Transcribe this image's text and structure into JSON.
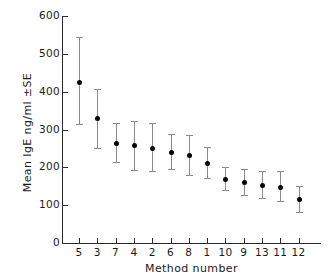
{
  "chart_data": {
    "type": "scatter",
    "title": "",
    "xlabel": "Method number",
    "ylabel": "Mean IgE ng/ml ±SE",
    "xlim": [
      0,
      14
    ],
    "ylim": [
      0,
      600
    ],
    "ytick_labels": [
      "600",
      "500",
      "400",
      "300",
      "200",
      "100",
      "0"
    ],
    "ytick_values": [
      600,
      500,
      400,
      300,
      200,
      100,
      0
    ],
    "grid": false,
    "legend": null,
    "error_bars": "±SE",
    "categories": [
      "5",
      "3",
      "7",
      "4",
      "2",
      "6",
      "8",
      "1",
      "10",
      "9",
      "13",
      "11",
      "12"
    ],
    "values": [
      425,
      330,
      265,
      258,
      252,
      240,
      232,
      212,
      168,
      160,
      152,
      148,
      115
    ],
    "err_low": [
      315,
      250,
      213,
      192,
      190,
      196,
      180,
      172,
      140,
      128,
      118,
      112,
      82
    ],
    "err_high": [
      545,
      408,
      318,
      322,
      318,
      288,
      285,
      255,
      200,
      196,
      190,
      190,
      150
    ],
    "points": [
      {
        "method": "5",
        "mean": 425,
        "low": 315,
        "high": 545
      },
      {
        "method": "3",
        "mean": 330,
        "low": 250,
        "high": 408
      },
      {
        "method": "7",
        "mean": 265,
        "low": 213,
        "high": 318
      },
      {
        "method": "4",
        "mean": 258,
        "low": 192,
        "high": 322
      },
      {
        "method": "2",
        "mean": 252,
        "low": 190,
        "high": 318
      },
      {
        "method": "6",
        "mean": 240,
        "low": 196,
        "high": 288
      },
      {
        "method": "8",
        "mean": 232,
        "low": 180,
        "high": 285
      },
      {
        "method": "1",
        "mean": 212,
        "low": 172,
        "high": 255
      },
      {
        "method": "10",
        "mean": 168,
        "low": 140,
        "high": 200
      },
      {
        "method": "9",
        "mean": 160,
        "low": 128,
        "high": 196
      },
      {
        "method": "13",
        "mean": 152,
        "low": 118,
        "high": 190
      },
      {
        "method": "11",
        "mean": 148,
        "low": 112,
        "high": 190
      },
      {
        "method": "12",
        "mean": 115,
        "low": 82,
        "high": 150
      }
    ],
    "colors": {
      "marker": "#000000",
      "error_bar": "#8a8a8a",
      "axis": "#2b2b2b",
      "text": "#1a1a1a",
      "background": "#ffffff"
    }
  }
}
